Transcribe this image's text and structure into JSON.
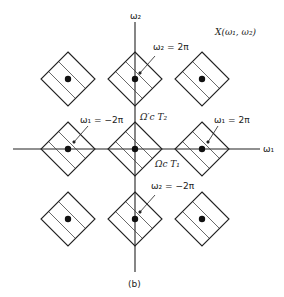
{
  "figure": {
    "title": "X(ω₁, ω₂)",
    "caption": "(b)",
    "axes": {
      "x_label": "ω₁",
      "y_label": "ω₂"
    },
    "annotations": {
      "w2_pos": "ω₂ = 2π",
      "w2_neg": "ω₂ = −2π",
      "w1_neg": "ω₁ = −2π",
      "w1_pos": "ω₁ = 2π",
      "omega_t2": "Ω′c T₂",
      "omega_t1": "Ωc T₁"
    },
    "grid": {
      "rows": 3,
      "cols": 3,
      "cell_shape": "diamond",
      "fill": "hatched",
      "center_marker": "dot"
    },
    "colors": {
      "ink": "#222222",
      "background": "#ffffff"
    }
  }
}
